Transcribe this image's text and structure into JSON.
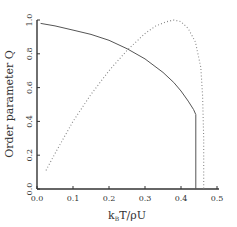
{
  "chart_data": {
    "type": "line",
    "title": "",
    "xlabel": "k_B T/ρU",
    "xlabel_parts": {
      "k": "k",
      "sub": "B",
      "rest": "T/ρU"
    },
    "ylabel": "Order parameter Q",
    "xlim": [
      0.0,
      0.5
    ],
    "ylim": [
      0.0,
      1.0
    ],
    "x_ticks": [
      "0.0",
      "0.1",
      "0.2",
      "0.3",
      "0.4",
      "0.5"
    ],
    "y_ticks": [
      "0.0",
      "0.2",
      "0.4",
      "0.6",
      "0.8",
      "1.0"
    ],
    "grid": false,
    "legend": null,
    "series": [
      {
        "name": "solid",
        "style": "solid",
        "x": [
          0.01,
          0.05,
          0.1,
          0.15,
          0.2,
          0.25,
          0.3,
          0.35,
          0.38,
          0.4,
          0.42,
          0.435,
          0.441,
          0.441
        ],
        "y": [
          0.98,
          0.965,
          0.94,
          0.915,
          0.88,
          0.83,
          0.77,
          0.69,
          0.63,
          0.58,
          0.52,
          0.47,
          0.44,
          0.0
        ]
      },
      {
        "name": "dotted",
        "style": "dotted",
        "x": [
          0.025,
          0.05,
          0.1,
          0.15,
          0.2,
          0.25,
          0.3,
          0.33,
          0.36,
          0.38,
          0.4,
          0.42,
          0.44,
          0.455,
          0.46,
          0.463,
          0.463
        ],
        "y": [
          0.11,
          0.21,
          0.4,
          0.56,
          0.7,
          0.82,
          0.92,
          0.965,
          0.99,
          1.0,
          0.99,
          0.95,
          0.87,
          0.72,
          0.55,
          0.3,
          0.0
        ]
      }
    ]
  }
}
